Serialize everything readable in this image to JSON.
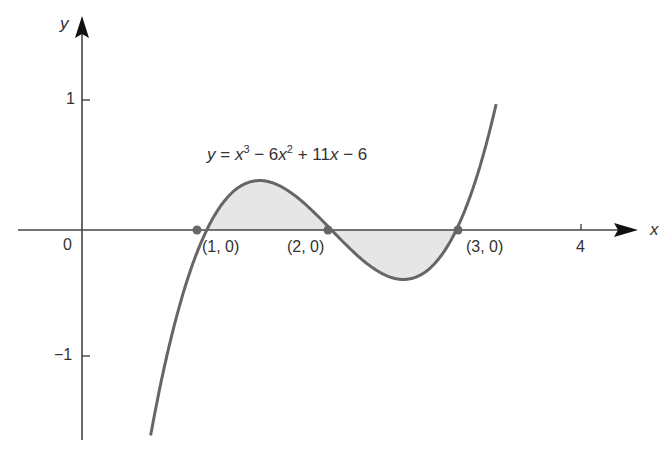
{
  "chart_data": {
    "type": "line",
    "title": "",
    "equation": "y = x^3 - 6x^2 + 11x - 6",
    "equation_parts": {
      "y": "y",
      "eq": " = ",
      "x1": "x",
      "p1": "3",
      "t2": " − 6",
      "x2": "x",
      "p2": "2",
      "t3": " + 11",
      "x3": "x",
      "t4": " − 6"
    },
    "xlabel": "x",
    "ylabel": "y",
    "xlim": [
      -0.5,
      4.5
    ],
    "ylim": [
      -1.6,
      1.6
    ],
    "x_ticks": [
      {
        "value": 0,
        "label": "0"
      },
      {
        "value": 4,
        "label": "4"
      }
    ],
    "y_ticks": [
      {
        "value": 1,
        "label": "1"
      },
      {
        "value": -1,
        "label": "−1"
      }
    ],
    "series": [
      {
        "name": "y = x^3 - 6x^2 + 11x - 6",
        "x": [
          0.55,
          1.0,
          1.42,
          2.0,
          2.58,
          3.0,
          3.32
        ],
        "values": [
          -1.6,
          0,
          0.385,
          0,
          -0.385,
          0,
          1.6
        ]
      }
    ],
    "points": [
      {
        "x": 1,
        "y": 0,
        "label": "(1, 0)"
      },
      {
        "x": 2,
        "y": 0,
        "label": "(2, 0)"
      },
      {
        "x": 3,
        "y": 0,
        "label": "(3, 0)"
      }
    ],
    "shaded_regions": [
      {
        "from": 1,
        "to": 2,
        "sign": "positive"
      },
      {
        "from": 2,
        "to": 3,
        "sign": "negative"
      }
    ],
    "grid": false,
    "legend": "none"
  }
}
